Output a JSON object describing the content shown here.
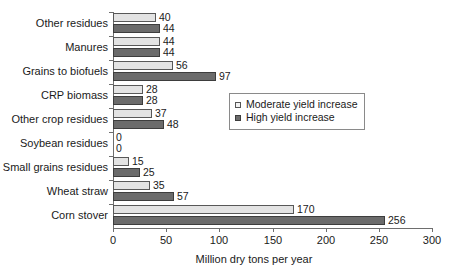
{
  "chart_data": {
    "type": "bar",
    "orientation": "horizontal",
    "title": "",
    "xlabel": "Million dry tons per year",
    "ylabel": "",
    "xlim": [
      0,
      300
    ],
    "xticks": [
      0,
      50,
      100,
      150,
      200,
      250,
      300
    ],
    "grid": false,
    "legend_position": "center-right",
    "categories": [
      "Other residues",
      "Manures",
      "Grains to biofuels",
      "CRP biomass",
      "Other crop residues",
      "Soybean residues",
      "Small grains residues",
      "Wheat straw",
      "Corn stover"
    ],
    "series": [
      {
        "name": "Moderate yield increase",
        "color": "#e3e3e3",
        "values": [
          40,
          44,
          56,
          28,
          37,
          0,
          15,
          35,
          170
        ]
      },
      {
        "name": "High yield increase",
        "color": "#6b6b6b",
        "values": [
          44,
          44,
          97,
          28,
          48,
          0,
          25,
          57,
          256
        ]
      }
    ]
  },
  "legend": {
    "items": [
      {
        "label": "Moderate yield increase",
        "marker": "open-square-marker"
      },
      {
        "label": "High yield increase",
        "marker": "filled-square-marker"
      }
    ]
  },
  "axis": {
    "x_title": "Million dry tons per year",
    "x_tick_labels": [
      "0",
      "50",
      "100",
      "150",
      "200",
      "250",
      "300"
    ]
  }
}
